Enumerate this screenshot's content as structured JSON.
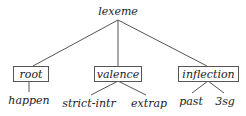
{
  "diagram": {
    "type": "type-hierarchy-tree",
    "root": {
      "label": "lexeme",
      "boxed": false
    },
    "dimensions": [
      {
        "label": "root",
        "boxed": true,
        "children": [
          {
            "label": "happen"
          }
        ]
      },
      {
        "label": "valence",
        "boxed": true,
        "children": [
          {
            "label": "strict-intr"
          },
          {
            "label": "extrap"
          }
        ]
      },
      {
        "label": "inflection",
        "boxed": true,
        "children": [
          {
            "label": "past"
          },
          {
            "label": "3sg"
          }
        ]
      }
    ],
    "colors": {
      "line": "#555555",
      "text": "#222222",
      "background": "#ffffff"
    }
  }
}
